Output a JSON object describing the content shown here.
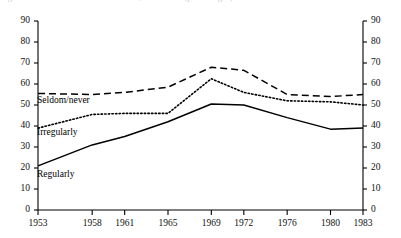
{
  "title_sliver": "Figure 1. Church attendance in Britain, 1953-1983 (percentages)",
  "chart_data": {
    "type": "line",
    "title": "",
    "xlabel": "",
    "ylabel": "",
    "x": [
      "1953",
      "1958",
      "1961",
      "1965",
      "1969",
      "1972",
      "1976",
      "1980",
      "1983"
    ],
    "categories": [
      "1953",
      "1958",
      "1961",
      "1965",
      "1969",
      "1972",
      "1976",
      "1980",
      "1983"
    ],
    "ylim": [
      0,
      90
    ],
    "y_ticks": [
      0,
      10,
      20,
      30,
      40,
      50,
      60,
      70,
      80,
      90
    ],
    "right_axis": true,
    "right_y_ticks": [
      0,
      10,
      20,
      30,
      40,
      50,
      60,
      70,
      80,
      90
    ],
    "grid": false,
    "legend_position": "inline-labels",
    "series": [
      {
        "name": "Seldom/never",
        "style": "dashed",
        "color": "#000000",
        "values": [
          55.5,
          55,
          56,
          58.5,
          68,
          66.5,
          55,
          54,
          55
        ]
      },
      {
        "name": "Irregularly",
        "style": "dotted",
        "color": "#000000",
        "values": [
          39,
          45.5,
          46,
          46,
          62.5,
          56,
          52,
          51.5,
          50
        ]
      },
      {
        "name": "Regularly",
        "style": "solid",
        "color": "#000000",
        "values": [
          21,
          31,
          35,
          42,
          50.5,
          50,
          44,
          38.5,
          39
        ]
      }
    ],
    "annotations": [
      {
        "text": "Seldom/never",
        "x": "1953",
        "y": 52
      },
      {
        "text": "Irregularly",
        "x": "1953",
        "y": 35
      },
      {
        "text": "Regularly",
        "x": "1953",
        "y": 17
      }
    ]
  },
  "axis": {
    "left_labels": [
      "90",
      "80",
      "70",
      "60",
      "50",
      "40",
      "30",
      "20",
      "10",
      "0"
    ],
    "right_labels": [
      "90",
      "80",
      "70",
      "60",
      "50",
      "40",
      "30",
      "20",
      "10",
      "0"
    ],
    "x_labels": [
      "1953",
      "1958",
      "1961",
      "1965",
      "1969",
      "1972",
      "1976",
      "1980",
      "1983"
    ]
  },
  "labels": {
    "seldom_never": "Seldom/never",
    "irregularly": "Irregularly",
    "regularly": "Regularly"
  }
}
